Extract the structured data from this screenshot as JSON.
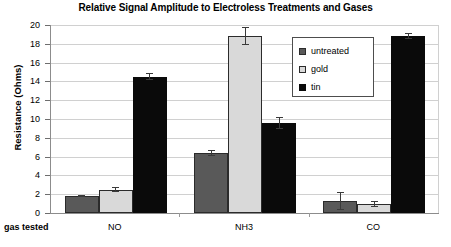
{
  "chart_data": {
    "type": "bar",
    "title": "Relative Signal Amplitude to Electroless Treatments and Gases",
    "xlabel": "gas tested",
    "ylabel": "Resistance (Ohms)",
    "categories": [
      "NO",
      "NH3",
      "CO"
    ],
    "ylim": [
      0,
      20
    ],
    "yticks": [
      0,
      2,
      4,
      6,
      8,
      10,
      12,
      14,
      16,
      18,
      20
    ],
    "grid": true,
    "legend_position": "upper right",
    "series": [
      {
        "name": "untreated",
        "color": "#595959",
        "values": [
          1.8,
          6.35,
          1.3
        ],
        "errors": [
          0.15,
          0.3,
          0.95
        ]
      },
      {
        "name": "gold",
        "color": "#d9d9d9",
        "values": [
          2.5,
          18.85,
          0.95
        ],
        "errors": [
          0.25,
          0.95,
          0.35
        ]
      },
      {
        "name": "tin",
        "color": "#0a0a0a",
        "values": [
          14.5,
          9.6,
          18.8
        ],
        "errors": [
          0.35,
          0.65,
          0.3
        ]
      }
    ]
  },
  "axis": {
    "y_tick_labels": [
      "20",
      "18",
      "16",
      "14",
      "12",
      "10",
      "8",
      "6",
      "4",
      "2",
      "0"
    ],
    "x_axis_name": "gas tested",
    "y_axis_title": "Resistance (Ohms)"
  },
  "legend": {
    "items": [
      {
        "label": "untreated"
      },
      {
        "label": "gold"
      },
      {
        "label": "tin"
      }
    ]
  }
}
